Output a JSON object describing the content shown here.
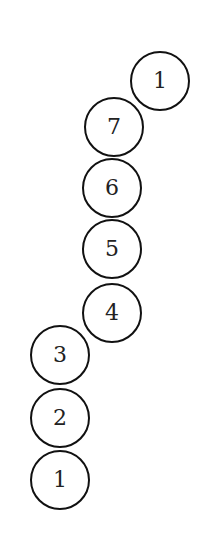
{
  "diagram": {
    "stroke_color": "#111111",
    "nodes": [
      {
        "label": "1",
        "cx": 160,
        "cy": 81
      },
      {
        "label": "7",
        "cx": 114,
        "cy": 127
      },
      {
        "label": "6",
        "cx": 112,
        "cy": 188
      },
      {
        "label": "5",
        "cx": 112,
        "cy": 249
      },
      {
        "label": "4",
        "cx": 112,
        "cy": 313
      },
      {
        "label": "3",
        "cx": 60,
        "cy": 355
      },
      {
        "label": "2",
        "cx": 60,
        "cy": 418
      },
      {
        "label": "1",
        "cx": 60,
        "cy": 480
      }
    ]
  }
}
